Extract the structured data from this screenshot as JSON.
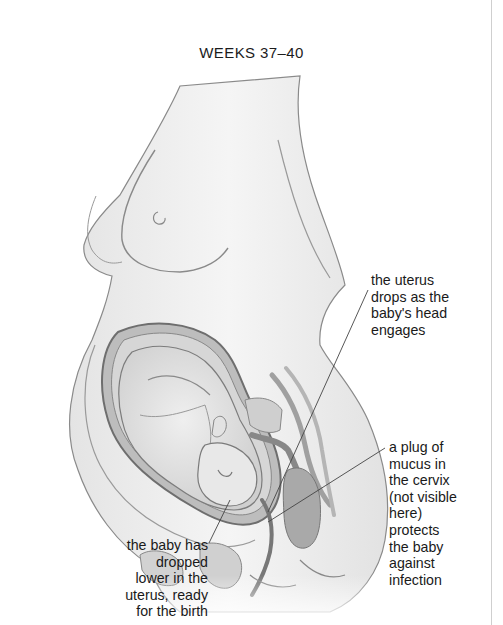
{
  "title": "WEEKS 37–40",
  "illustration": {
    "subject": "side view of pregnant woman's torso showing fetus in uterus",
    "colors": {
      "skin_fill": "#f1f1f1",
      "outline": "#7a7a7a",
      "uterus_wall": "#8c8c8c",
      "fetus_fill": "#e6e6e6",
      "organ_dark": "#9a9a9a",
      "leader_line": "#444444"
    }
  },
  "labels": {
    "uterus": {
      "lines": [
        "the uterus",
        "drops as the",
        "baby's head",
        "engages"
      ]
    },
    "plug": {
      "lines": [
        "a plug of",
        "mucus in",
        "the cervix",
        "(not visible",
        "here)",
        "protects",
        "the baby",
        "against",
        "infection"
      ]
    },
    "baby": {
      "lines": [
        "the baby has",
        "dropped",
        "lower in the",
        "uterus, ready",
        "for the birth"
      ]
    }
  }
}
